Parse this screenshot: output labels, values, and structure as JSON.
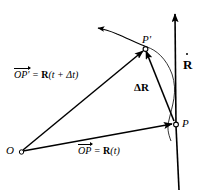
{
  "figure": {
    "type": "vector-diagram",
    "background_color": "#ffffff",
    "stroke_color": "#000000",
    "points": [
      {
        "id": "O",
        "label": "O",
        "x": 22,
        "y": 151
      },
      {
        "id": "P",
        "label": "P",
        "x": 176,
        "y": 124
      },
      {
        "id": "Pp",
        "label": "P'",
        "x": 146,
        "y": 49
      }
    ],
    "labels": {
      "origin": "O",
      "point_p": "P",
      "point_p_prime": "P'",
      "vector_op_prime_head": "OP'",
      "vector_op_prime_eq": " = ",
      "vector_op_prime_value": "R",
      "vector_op_prime_arg": "(t + Δt)",
      "vector_op_head": "OP",
      "vector_op_eq": " = ",
      "vector_op_value": "R",
      "vector_op_arg": "(t)",
      "delta_r": "ΔR",
      "r_dot": "R"
    },
    "vectors": [
      {
        "name": "OP'",
        "from": "O",
        "to": "P'",
        "label": "OP' = R(t + Δt)"
      },
      {
        "name": "OP",
        "from": "O",
        "to": "P",
        "label": "OP = R(t)"
      },
      {
        "name": "ΔR",
        "from": "P",
        "to": "P'",
        "label": "ΔR"
      },
      {
        "name": "R-dot",
        "from": "P",
        "to": "axis-top",
        "label": "Ṙ"
      }
    ],
    "trajectory": {
      "name": "path-of-particle",
      "description": "curved path through P and P' with arrowhead at upper left"
    }
  }
}
